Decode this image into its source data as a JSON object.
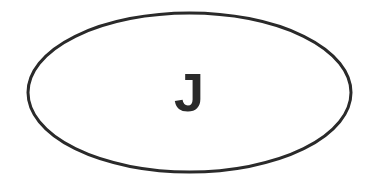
{
  "diagram": {
    "shape": "ellipse",
    "label": "J",
    "stroke_color": "#2a2a2a",
    "fill_color": "#ffffff",
    "text_color": "#2a2a2a"
  }
}
